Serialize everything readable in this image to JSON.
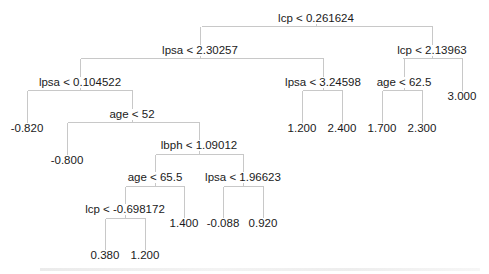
{
  "diagram": {
    "type": "regression-tree",
    "line_color": "#c8c8c8",
    "text_color": "#1a1a1a",
    "nodes": [
      {
        "id": "root",
        "label": "lcp < 0.261624",
        "x": 316,
        "y": 19,
        "bar_y": 26,
        "left": 201,
        "right": 432,
        "children": [
          "n1",
          "n2"
        ]
      },
      {
        "id": "n1",
        "label": "lpsa < 2.30257",
        "x": 200,
        "y": 51,
        "bar_y": 58,
        "left": 80,
        "right": 323,
        "children": [
          "n3",
          "n4"
        ]
      },
      {
        "id": "n2",
        "label": "lcp < 2.13963",
        "x": 432,
        "y": 51,
        "bar_y": 58,
        "left": 402,
        "right": 462,
        "children": [
          "n5",
          "leaf_3000"
        ]
      },
      {
        "id": "n3",
        "label": "lpsa < 0.104522",
        "x": 80,
        "y": 83,
        "bar_y": 90,
        "left": 27,
        "right": 132,
        "children": [
          "leaf_m0820",
          "n6"
        ]
      },
      {
        "id": "n4",
        "label": "lpsa < 3.24598",
        "x": 323,
        "y": 83,
        "bar_y": 90,
        "left": 302,
        "right": 342,
        "children": [
          "leaf_1200a",
          "leaf_2400"
        ]
      },
      {
        "id": "n5",
        "label": "age < 62.5",
        "x": 404,
        "y": 83,
        "bar_y": 90,
        "left": 382,
        "right": 422,
        "children": [
          "leaf_1700",
          "leaf_2300"
        ]
      },
      {
        "id": "n6",
        "label": "age < 52",
        "x": 132,
        "y": 115,
        "bar_y": 122,
        "left": 67,
        "right": 199,
        "children": [
          "leaf_m0800",
          "n7"
        ]
      },
      {
        "id": "n7",
        "label": "lbph < 1.09012",
        "x": 199,
        "y": 146,
        "bar_y": 154,
        "left": 155,
        "right": 243,
        "children": [
          "n8",
          "n9"
        ]
      },
      {
        "id": "n8",
        "label": "age < 65.5",
        "x": 155,
        "y": 178,
        "bar_y": 186,
        "left": 125,
        "right": 184,
        "children": [
          "n10",
          "leaf_1400"
        ]
      },
      {
        "id": "n9",
        "label": "lpsa < 1.96623",
        "x": 243,
        "y": 178,
        "bar_y": 186,
        "left": 223,
        "right": 263,
        "children": [
          "leaf_m0088",
          "leaf_0920"
        ]
      },
      {
        "id": "n10",
        "label": "lcp < -0.698172",
        "x": 125,
        "y": 210,
        "bar_y": 218,
        "left": 105,
        "right": 145,
        "children": [
          "leaf_0380",
          "leaf_1200b"
        ]
      }
    ],
    "leaves": [
      {
        "id": "leaf_3000",
        "value": "3.000",
        "x": 462,
        "y": 97
      },
      {
        "id": "leaf_m0820",
        "value": "-0.820",
        "x": 27,
        "y": 129
      },
      {
        "id": "leaf_1200a",
        "value": "1.200",
        "x": 302,
        "y": 129
      },
      {
        "id": "leaf_2400",
        "value": "2.400",
        "x": 342,
        "y": 129
      },
      {
        "id": "leaf_1700",
        "value": "1.700",
        "x": 382,
        "y": 129
      },
      {
        "id": "leaf_2300",
        "value": "2.300",
        "x": 422,
        "y": 129
      },
      {
        "id": "leaf_m0800",
        "value": "-0.800",
        "x": 67,
        "y": 161
      },
      {
        "id": "leaf_1400",
        "value": "1.400",
        "x": 184,
        "y": 224
      },
      {
        "id": "leaf_m0088",
        "value": "-0.088",
        "x": 223,
        "y": 224
      },
      {
        "id": "leaf_0920",
        "value": "0.920",
        "x": 263,
        "y": 224
      },
      {
        "id": "leaf_0380",
        "value": "0.380",
        "x": 105,
        "y": 256
      },
      {
        "id": "leaf_1200b",
        "value": "1.200",
        "x": 145,
        "y": 256
      }
    ]
  }
}
